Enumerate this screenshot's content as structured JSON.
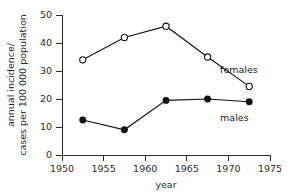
{
  "chart_data": {
    "type": "line",
    "title": "",
    "subtitle": "",
    "xlabel": "year",
    "ylabel": "annual incidence/ cases per 100 000 population",
    "ylabel_line1": "annual incidence/",
    "ylabel_line2": "cases per 100 000 population",
    "xlim": [
      1950,
      1975
    ],
    "ylim": [
      0,
      50
    ],
    "xticks": [
      1950,
      1955,
      1960,
      1965,
      1970,
      1975
    ],
    "xticklabels": [
      "1950",
      "1955",
      "1960",
      "1965",
      "1970",
      "1975"
    ],
    "yticks": [
      0,
      10,
      20,
      30,
      40,
      50
    ],
    "yticklabels": [
      "0",
      "10",
      "20",
      "30",
      "40",
      "50"
    ],
    "grid": false,
    "legend_position": "inline-right",
    "x": [
      1952.5,
      1957.5,
      1962.5,
      1967.5,
      1972.5
    ],
    "series": [
      {
        "name": "females",
        "marker": "open-circle",
        "color": "#111111",
        "values": [
          34,
          42,
          46,
          35,
          24.5
        ],
        "label": "females",
        "label_x": 1969.0,
        "label_y": 30.5
      },
      {
        "name": "males",
        "marker": "filled-circle",
        "color": "#111111",
        "values": [
          12.5,
          9,
          19.5,
          20,
          19
        ],
        "label": "males",
        "label_x": 1969.0,
        "label_y": 13.5
      }
    ]
  }
}
